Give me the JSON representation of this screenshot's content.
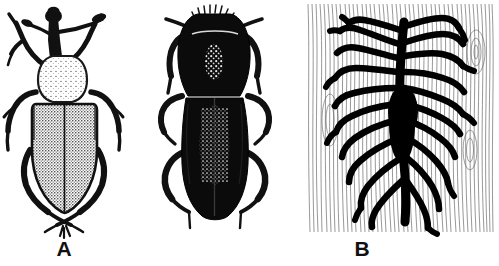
{
  "figure": {
    "background_color": "#ffffff",
    "ink_color": "#111111",
    "width": 499,
    "height": 266,
    "panel_count": 3
  },
  "panels": [
    {
      "id": "a",
      "label": "A",
      "subject": "weevil-dorsal-view",
      "description": "Dorsal view of a weevil with long snout, clubbed elbowed antennae, pear-shaped stippled pronotum and broad stippled elytra",
      "icon_name": "weevil-illustration",
      "label_x": 64,
      "label_y": 248
    },
    {
      "id": "b",
      "label": "B",
      "subject": "bark-beetle-dorsal-view",
      "description": "Dorsal view of a dark cylindrical bark beetle with hooded pronotum and punctured striate elytra",
      "icon_name": "bark-beetle-illustration",
      "label_x": 212,
      "label_y": 248
    },
    {
      "id": "c",
      "label": "C",
      "subject": "bark-beetle-gallery-pattern",
      "description": "Engraved gallery system in wood grain: a vertical egg gallery with about twenty radiating larval mines",
      "icon_name": "gallery-pattern-illustration",
      "label_x": 406,
      "label_y": 248,
      "block_bounds": {
        "x": 305,
        "y": 4,
        "width": 190,
        "height": 228
      },
      "grain_orientation": "vertical",
      "gallery_count_left": 10,
      "gallery_count_right": 10
    }
  ]
}
